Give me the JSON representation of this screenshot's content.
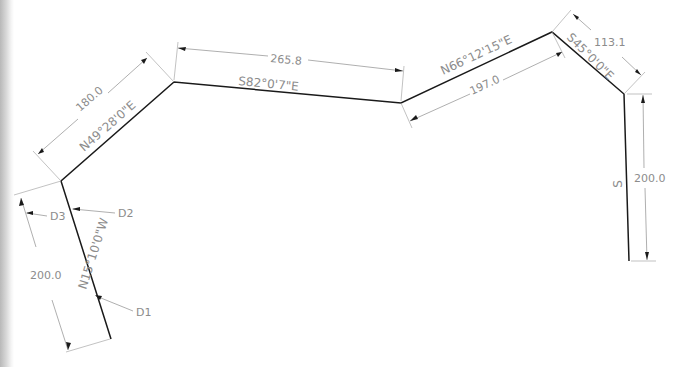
{
  "drawing": {
    "type": "survey traverse plot",
    "line_color": "#1a1a1a",
    "annotation_color": "#8c8c8c",
    "courses": [
      {
        "id": "course-1",
        "bearing": "N15°10'0\"W",
        "distance": "200.0"
      },
      {
        "id": "course-2",
        "bearing": "N49°28'0\"E",
        "distance": "180.0"
      },
      {
        "id": "course-3",
        "bearing": "S82°0'7\"E",
        "distance": "265.8"
      },
      {
        "id": "course-4",
        "bearing": "N66°12'15\"E",
        "distance": "197.0"
      },
      {
        "id": "course-5",
        "bearing": "S45°0'0\"E",
        "distance": "113.1"
      },
      {
        "id": "course-6",
        "bearing": "S",
        "distance": "200.0"
      }
    ],
    "callouts": [
      {
        "label": "D1"
      },
      {
        "label": "D2"
      },
      {
        "label": "D3"
      }
    ]
  }
}
